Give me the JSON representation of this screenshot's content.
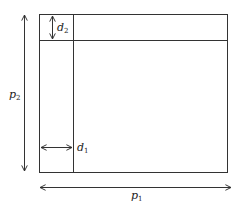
{
  "diagram": {
    "colors": {
      "stroke": "#333333",
      "background": "#ffffff"
    },
    "outer_rect": {
      "x": 39,
      "y": 14,
      "width": 188,
      "height": 158
    },
    "vertical_divider_x": 73,
    "horizontal_divider_y": 40,
    "labels": {
      "d2": {
        "main": "d",
        "sub": "2"
      },
      "d1": {
        "main": "d",
        "sub": "1"
      },
      "p2": {
        "main": "p",
        "sub": "2"
      },
      "p1": {
        "main": "p",
        "sub": "1"
      }
    },
    "arrows": [
      {
        "name": "d2-arrow",
        "orientation": "vertical",
        "double_headed": true,
        "x": 52,
        "y1": 15,
        "y2": 39
      },
      {
        "name": "d1-arrow",
        "orientation": "horizontal",
        "double_headed": true,
        "y": 147,
        "x1": 40,
        "x2": 72
      },
      {
        "name": "p2-arrow",
        "orientation": "vertical",
        "double_headed": true,
        "x": 24,
        "y1": 14,
        "y2": 172
      },
      {
        "name": "p1-arrow",
        "orientation": "horizontal",
        "double_headed": true,
        "y": 187,
        "x1": 39,
        "x2": 231
      }
    ]
  }
}
